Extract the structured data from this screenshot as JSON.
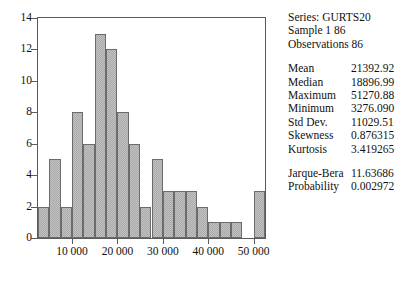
{
  "chart_data": {
    "type": "bar",
    "title": "",
    "subtitle": "",
    "xlabel": "",
    "ylabel": "",
    "ylim": [
      0,
      14
    ],
    "ytick_values": [
      0,
      2,
      4,
      6,
      8,
      10,
      12,
      14
    ],
    "ytick_labels": [
      "0",
      "2",
      "4",
      "6",
      "8",
      "10",
      "12",
      "14"
    ],
    "xlim": [
      2500,
      52500
    ],
    "xtick_values": [
      10000,
      20000,
      30000,
      40000,
      50000
    ],
    "xtick_labels": [
      "10 000",
      "20 000",
      "30 000",
      "40 000",
      "50 000"
    ],
    "grid": false,
    "legend": false,
    "bin_width": 2500,
    "bin_starts": [
      2500,
      5000,
      7500,
      10000,
      12500,
      15000,
      17500,
      20000,
      22500,
      25000,
      27500,
      30000,
      32500,
      35000,
      37500,
      40000,
      42500,
      45000,
      47500,
      50000
    ],
    "categories": [
      "2500",
      "5000",
      "7500",
      "10000",
      "12500",
      "15000",
      "17500",
      "20000",
      "22500",
      "25000",
      "27500",
      "30000",
      "32500",
      "35000",
      "37500",
      "40000",
      "42500",
      "45000",
      "47500",
      "50000"
    ],
    "values": [
      2,
      5,
      2,
      8,
      6,
      13,
      12,
      8,
      6,
      2,
      5,
      3,
      3,
      3,
      2,
      1,
      1,
      1,
      0,
      3
    ],
    "bar_color": "#a9a9a9",
    "bar_edge_color": "#6b6b6b"
  },
  "stats": {
    "header": [
      "Series: GURTS20",
      "Sample 1 86",
      "Observations 86"
    ],
    "rows": [
      {
        "label": "Mean",
        "value": "21392.92"
      },
      {
        "label": "Median",
        "value": "18896.99"
      },
      {
        "label": "Maximum",
        "value": "51270.88"
      },
      {
        "label": "Minimum",
        "value": "3276.090"
      },
      {
        "label": "Std Dev.",
        "value": "11029.51"
      },
      {
        "label": "Skewness",
        "value": "0.876315"
      },
      {
        "label": "Kurtosis",
        "value": "3.419265"
      }
    ],
    "rows2": [
      {
        "label": "Jarque-Bera",
        "value": "11.63686"
      },
      {
        "label": "Probability",
        "value": "0.002972"
      }
    ]
  }
}
